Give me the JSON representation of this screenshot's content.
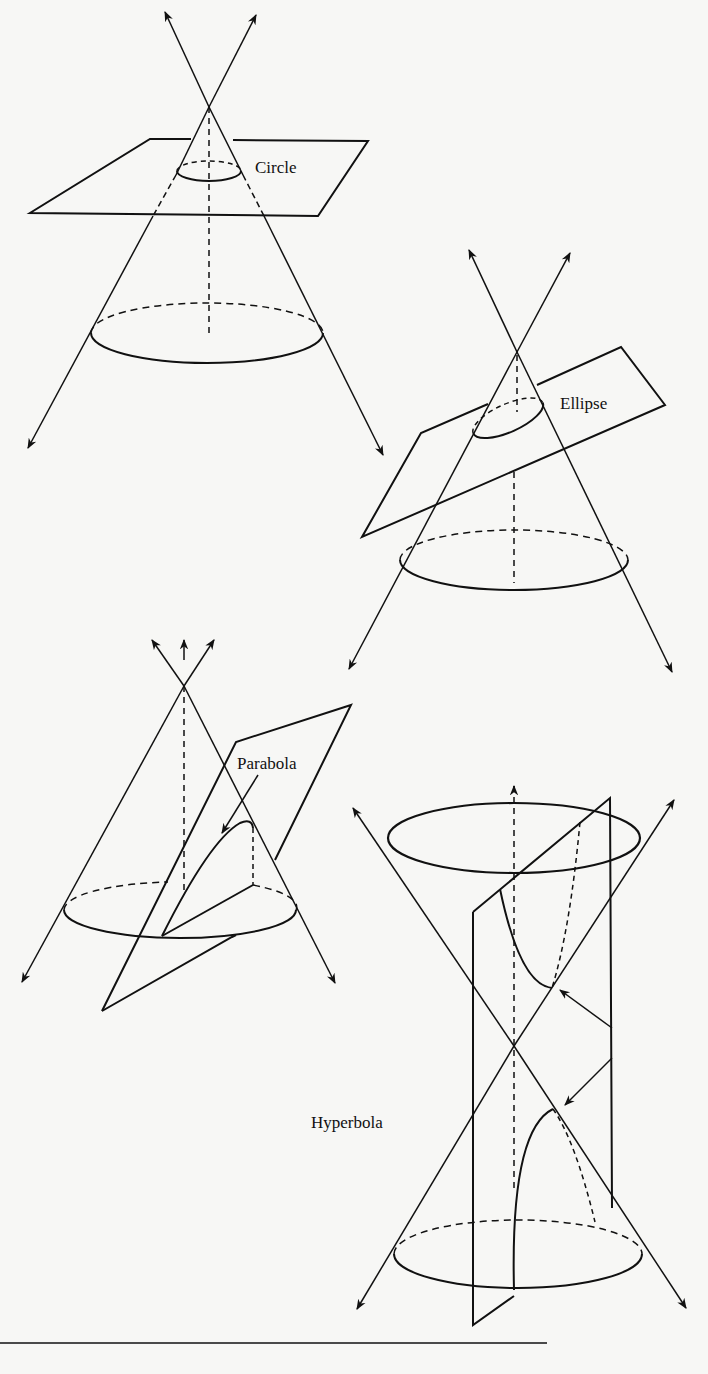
{
  "figure": {
    "type": "conic-sections",
    "panels": [
      {
        "id": "circle",
        "label": "Circle"
      },
      {
        "id": "ellipse",
        "label": "Ellipse"
      },
      {
        "id": "parabola",
        "label": "Parabola"
      },
      {
        "id": "hyperbola",
        "label": "Hyperbola"
      }
    ]
  },
  "colors": {
    "ink": "#111111",
    "paper": "#f7f7f5"
  }
}
